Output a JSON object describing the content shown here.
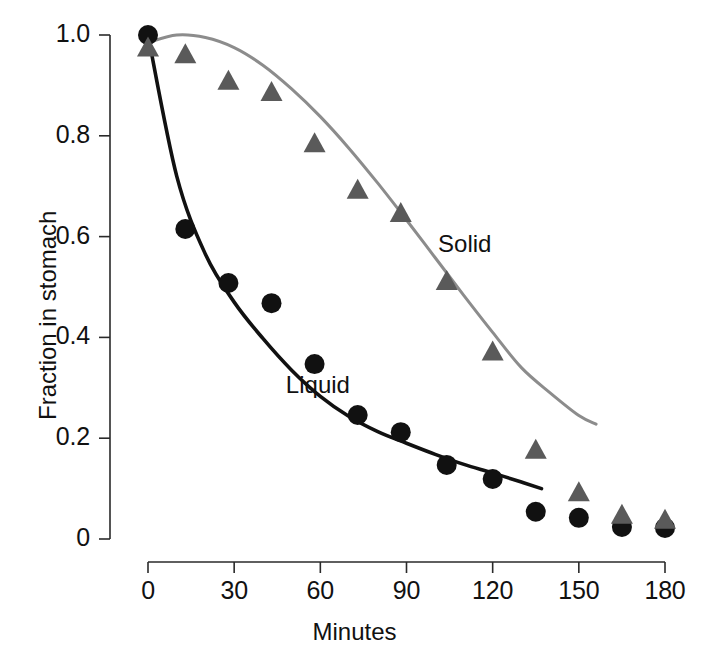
{
  "chart_data": {
    "type": "scatter",
    "title": "",
    "xlabel": "Minutes",
    "ylabel": "Fraction in stomach",
    "xlim": [
      0,
      180
    ],
    "ylim": [
      0,
      1.0
    ],
    "xticks": [
      0,
      30,
      60,
      90,
      120,
      150,
      180
    ],
    "xtick_labels": [
      "0",
      "30",
      "60",
      "90",
      "120",
      "150",
      "180"
    ],
    "yticks": [
      0,
      0.2,
      0.4,
      0.6,
      0.8,
      1.0
    ],
    "ytick_labels": [
      "0",
      "0.2",
      "0.4",
      "0.6",
      "0.8",
      "1.0"
    ],
    "grid": false,
    "legend_position": "inline-annotation",
    "series": [
      {
        "name": "Liquid",
        "marker": "circle",
        "color": "#111111",
        "curve_color": "#111111",
        "label_x": 48,
        "label_y": 0.305,
        "points": [
          {
            "x": 0,
            "y": 1.0
          },
          {
            "x": 13,
            "y": 0.615
          },
          {
            "x": 28,
            "y": 0.508
          },
          {
            "x": 43,
            "y": 0.468
          },
          {
            "x": 58,
            "y": 0.347
          },
          {
            "x": 73,
            "y": 0.246
          },
          {
            "x": 88,
            "y": 0.212
          },
          {
            "x": 104,
            "y": 0.147
          },
          {
            "x": 120,
            "y": 0.119
          },
          {
            "x": 135,
            "y": 0.054
          },
          {
            "x": 150,
            "y": 0.042
          },
          {
            "x": 165,
            "y": 0.024
          },
          {
            "x": 180,
            "y": 0.022
          }
        ],
        "fit_curve": [
          {
            "x": 0,
            "y": 1.0
          },
          {
            "x": 10,
            "y": 0.72
          },
          {
            "x": 20,
            "y": 0.565
          },
          {
            "x": 30,
            "y": 0.47
          },
          {
            "x": 40,
            "y": 0.398
          },
          {
            "x": 50,
            "y": 0.335
          },
          {
            "x": 60,
            "y": 0.283
          },
          {
            "x": 70,
            "y": 0.243
          },
          {
            "x": 80,
            "y": 0.213
          },
          {
            "x": 90,
            "y": 0.19
          },
          {
            "x": 100,
            "y": 0.168
          },
          {
            "x": 110,
            "y": 0.148
          },
          {
            "x": 120,
            "y": 0.131
          },
          {
            "x": 130,
            "y": 0.113
          },
          {
            "x": 137,
            "y": 0.1
          }
        ]
      },
      {
        "name": "Solid",
        "marker": "triangle",
        "color": "#5a5a5a",
        "curve_color": "#8c8c8c",
        "label_x": 101,
        "label_y": 0.585,
        "points": [
          {
            "x": 0,
            "y": 0.975
          },
          {
            "x": 13,
            "y": 0.962
          },
          {
            "x": 28,
            "y": 0.909
          },
          {
            "x": 43,
            "y": 0.887
          },
          {
            "x": 58,
            "y": 0.785
          },
          {
            "x": 73,
            "y": 0.693
          },
          {
            "x": 88,
            "y": 0.647
          },
          {
            "x": 104,
            "y": 0.512
          },
          {
            "x": 120,
            "y": 0.372
          },
          {
            "x": 135,
            "y": 0.177
          },
          {
            "x": 150,
            "y": 0.093
          },
          {
            "x": 165,
            "y": 0.048
          },
          {
            "x": 180,
            "y": 0.038
          }
        ],
        "fit_curve": [
          {
            "x": 0,
            "y": 0.985
          },
          {
            "x": 10,
            "y": 1.0
          },
          {
            "x": 20,
            "y": 0.995
          },
          {
            "x": 30,
            "y": 0.975
          },
          {
            "x": 40,
            "y": 0.94
          },
          {
            "x": 50,
            "y": 0.893
          },
          {
            "x": 60,
            "y": 0.838
          },
          {
            "x": 70,
            "y": 0.775
          },
          {
            "x": 80,
            "y": 0.706
          },
          {
            "x": 90,
            "y": 0.633
          },
          {
            "x": 100,
            "y": 0.558
          },
          {
            "x": 110,
            "y": 0.483
          },
          {
            "x": 120,
            "y": 0.41
          },
          {
            "x": 130,
            "y": 0.34
          },
          {
            "x": 140,
            "y": 0.29
          },
          {
            "x": 150,
            "y": 0.245
          },
          {
            "x": 156,
            "y": 0.228
          }
        ]
      }
    ]
  },
  "axes": {
    "x_axis_name": "minutes-axis",
    "y_axis_name": "fraction-axis"
  }
}
